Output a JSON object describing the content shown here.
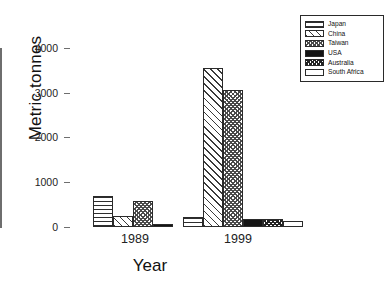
{
  "chart_data": {
    "type": "bar",
    "title": "",
    "xlabel": "Year",
    "ylabel": "Metric tonnes",
    "categories": [
      "1989",
      "1999"
    ],
    "ylim": [
      0,
      4000
    ],
    "yticks": [
      "0",
      "1000",
      "2000",
      "3000",
      "4000"
    ],
    "grid": false,
    "legend_position": "top-right",
    "series": [
      {
        "name": "Japan",
        "pattern": "horizontal-lines",
        "values": [
          690,
          230
        ]
      },
      {
        "name": "China",
        "pattern": "diagonal-hatch",
        "values": [
          245,
          3550
        ]
      },
      {
        "name": "Taiwan",
        "pattern": "checker-dense",
        "values": [
          580,
          3060
        ]
      },
      {
        "name": "USA",
        "pattern": "solid-black",
        "values": [
          75,
          175
        ]
      },
      {
        "name": "Australia",
        "pattern": "checker-dark",
        "values": [
          0,
          180
        ]
      },
      {
        "name": "South Africa",
        "pattern": "white-empty",
        "values": [
          0,
          140
        ]
      }
    ]
  },
  "legend": {
    "items": [
      {
        "label": "Japan"
      },
      {
        "label": "China"
      },
      {
        "label": "Taiwan"
      },
      {
        "label": "USA"
      },
      {
        "label": "Australia"
      },
      {
        "label": "South Africa"
      }
    ]
  }
}
